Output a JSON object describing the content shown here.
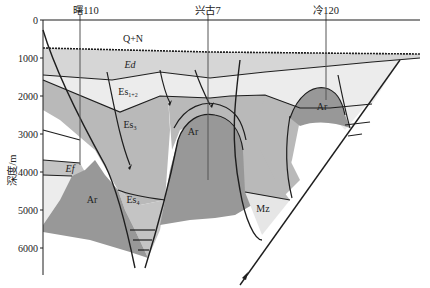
{
  "figure": {
    "type": "geological-cross-section",
    "y_axis": {
      "label": "深度/m",
      "ticks": [
        "0",
        "1000",
        "2000",
        "3000",
        "4000",
        "5000",
        "6000"
      ]
    },
    "wells": [
      {
        "name": "曙110"
      },
      {
        "name": "兴古7"
      },
      {
        "name": "冷120"
      }
    ],
    "units": {
      "QN": "Q+N",
      "Ed": "Ed",
      "Es12": "Es",
      "Es12_sub": "1+2",
      "Es3": "Es",
      "Es3_sub": "3",
      "Es4": "Es",
      "Es4_sub": "4",
      "Ef": "Ef",
      "Ar1": "Ar",
      "Ar2": "Ar",
      "Ar3": "Ar",
      "Ar4": "Ar",
      "Mz": "Mz"
    },
    "colors": {
      "QN": "#ffffff",
      "Ed": "#d6d6d6",
      "Es12": "#ececec",
      "Es3": "#b9b9b9",
      "Es4": "#c4c4c4",
      "Ar": "#989898",
      "Mz": "#e6e6e6",
      "line": "#1e1e1e"
    }
  }
}
